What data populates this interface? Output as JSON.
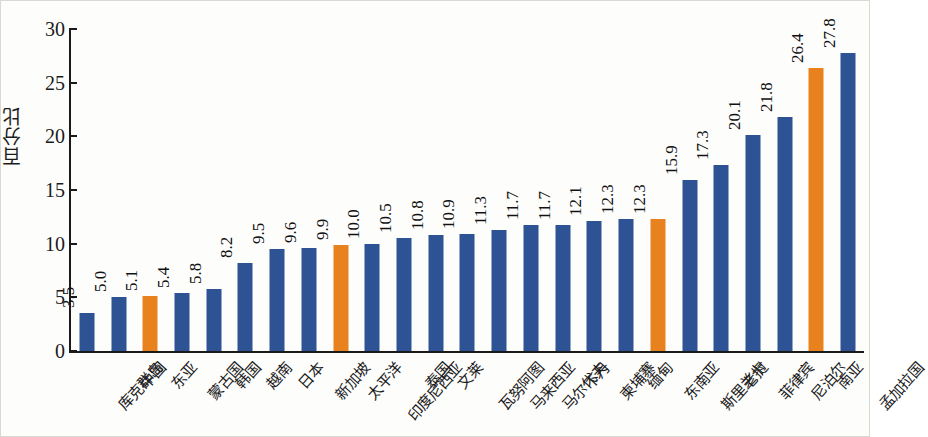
{
  "chart_data": {
    "type": "bar",
    "title": "",
    "subtitle": "",
    "xlabel": "",
    "ylabel": "百分比",
    "ylim": [
      0,
      30
    ],
    "yticks": [
      0,
      5,
      10,
      15,
      20,
      25,
      30
    ],
    "grid": false,
    "legend": null,
    "label_rotation_x": -48,
    "label_rotation_value": -90,
    "colors": {
      "bar_default": "#2e5395",
      "bar_highlight": "#e8821e",
      "axis": "#1a1a1a",
      "background": "#fdfdfc",
      "text": "#111111"
    },
    "categories": [
      "库克群岛",
      "中国",
      "东亚",
      "蒙古国",
      "韩国",
      "越南",
      "日本",
      "新加坡",
      "太平洋",
      "印度尼西亚",
      "泰国",
      "文莱",
      "瓦努阿图",
      "马来西亚",
      "马尔代夫",
      "不丹",
      "柬埔寨",
      "缅甸",
      "东南亚",
      "斯里兰卡",
      "老挝",
      "菲律宾",
      "尼泊尔",
      "南亚",
      "孟加拉国"
    ],
    "values": [
      3.5,
      5.0,
      5.1,
      5.4,
      5.8,
      8.2,
      9.5,
      9.6,
      9.9,
      10.0,
      10.5,
      10.8,
      10.9,
      11.3,
      11.7,
      11.7,
      12.1,
      12.3,
      12.3,
      15.9,
      17.3,
      20.1,
      21.8,
      26.4,
      27.8
    ],
    "value_labels": [
      "3.5",
      "5.0",
      "5.1",
      "5.4",
      "5.8",
      "8.2",
      "9.5",
      "9.6",
      "9.9",
      "10.0",
      "10.5",
      "10.8",
      "10.9",
      "11.3",
      "11.7",
      "11.7",
      "12.1",
      "12.3",
      "12.3",
      "15.9",
      "17.3",
      "20.1",
      "21.8",
      "26.4",
      "27.8"
    ],
    "highlighted": [
      false,
      false,
      true,
      false,
      false,
      false,
      false,
      false,
      true,
      false,
      false,
      false,
      false,
      false,
      false,
      false,
      false,
      false,
      true,
      false,
      false,
      false,
      false,
      true,
      false
    ]
  }
}
